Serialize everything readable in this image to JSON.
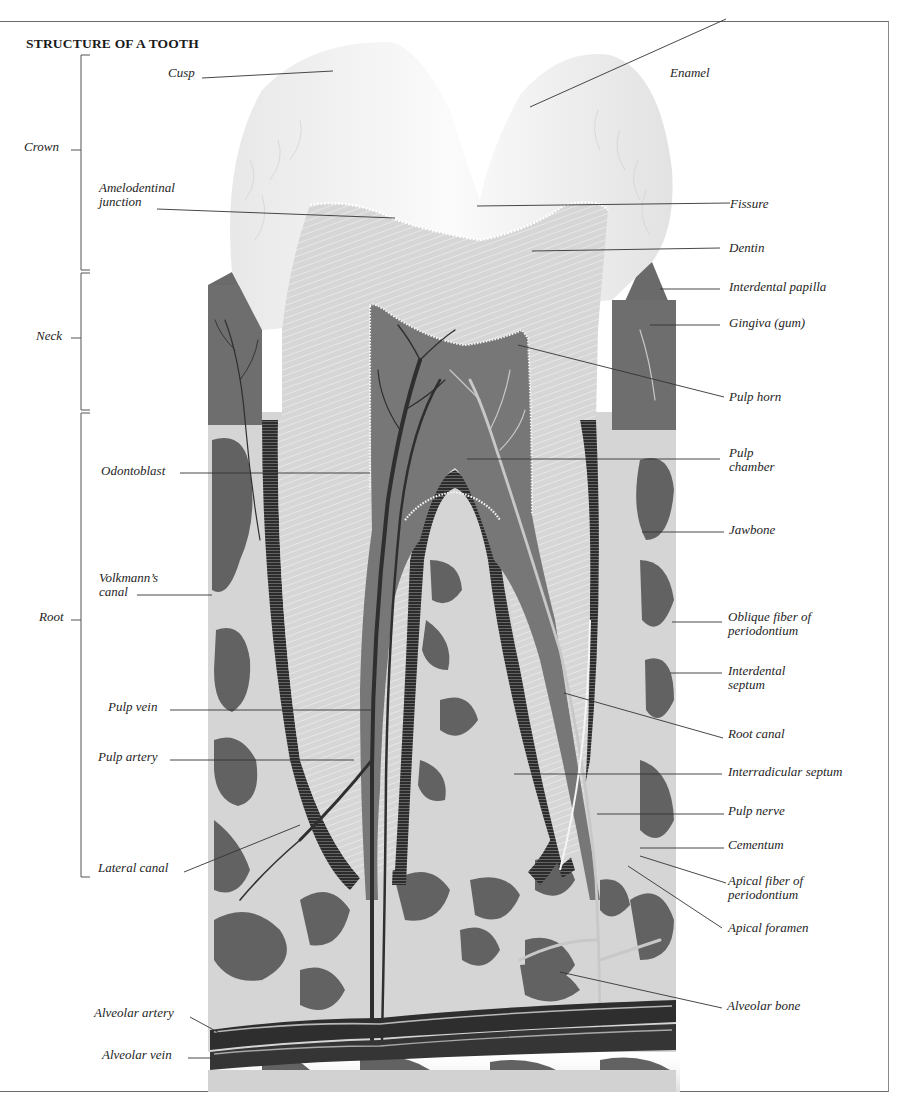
{
  "title": "STRUCTURE OF A TOOTH",
  "regions": [
    {
      "label": "Crown",
      "top": 55,
      "bottom": 270,
      "label_y": 146
    },
    {
      "label": "Neck",
      "top": 273,
      "bottom": 410,
      "label_y": 334
    },
    {
      "label": "Root",
      "top": 413,
      "bottom": 877,
      "label_y": 616
    }
  ],
  "labels_left": [
    {
      "text": "Cusp",
      "lines": [
        "Cusp"
      ]
    },
    {
      "text": "Amelodentinal junction",
      "lines": [
        "Amelodentinal",
        "junction"
      ]
    },
    {
      "text": "Odontoblast",
      "lines": [
        "Odontoblast"
      ]
    },
    {
      "text": "Volkmann's canal",
      "lines": [
        "Volkmann’s",
        "canal"
      ]
    },
    {
      "text": "Pulp vein",
      "lines": [
        "Pulp vein"
      ]
    },
    {
      "text": "Pulp artery",
      "lines": [
        "Pulp artery"
      ]
    },
    {
      "text": "Lateral canal",
      "lines": [
        "Lateral canal"
      ]
    },
    {
      "text": "Alveolar artery",
      "lines": [
        "Alveolar artery"
      ]
    },
    {
      "text": "Alveolar vein",
      "lines": [
        "Alveolar vein"
      ]
    }
  ],
  "labels_right": [
    {
      "text": "Enamel",
      "lines": [
        "Enamel"
      ]
    },
    {
      "text": "Fissure",
      "lines": [
        "Fissure"
      ]
    },
    {
      "text": "Dentin",
      "lines": [
        "Dentin"
      ]
    },
    {
      "text": "Interdental papilla",
      "lines": [
        "Interdental papilla"
      ]
    },
    {
      "text": "Gingiva (gum)",
      "lines": [
        "Gingiva (gum)"
      ]
    },
    {
      "text": "Pulp horn",
      "lines": [
        "Pulp horn"
      ]
    },
    {
      "text": "Pulp chamber",
      "lines": [
        "Pulp",
        "chamber"
      ]
    },
    {
      "text": "Jawbone",
      "lines": [
        "Jawbone"
      ]
    },
    {
      "text": "Oblique fiber of periodontium",
      "lines": [
        "Oblique fiber of",
        "periodontium"
      ]
    },
    {
      "text": "Interdental septum",
      "lines": [
        "Interdental",
        "septum"
      ]
    },
    {
      "text": "Root canal",
      "lines": [
        "Root canal"
      ]
    },
    {
      "text": "Interradicular septum",
      "lines": [
        "Interradicular septum"
      ]
    },
    {
      "text": "Pulp nerve",
      "lines": [
        "Pulp nerve"
      ]
    },
    {
      "text": "Cementum",
      "lines": [
        "Cementum"
      ]
    },
    {
      "text": "Apical fiber of periodontium",
      "lines": [
        "Apical fiber of",
        "periodontium"
      ]
    },
    {
      "text": "Apical foramen",
      "lines": [
        "Apical foramen"
      ]
    },
    {
      "text": "Alveolar bone",
      "lines": [
        "Alveolar bone"
      ]
    }
  ],
  "colors": {
    "enamel": "#f2f2f2",
    "dentin": "#dcdcdc",
    "gum": "#6f6f6f",
    "pulp": "#757575",
    "bone_light": "#d8d8d8",
    "bone_dark": "#616161",
    "vessel": "#3a3a3a",
    "leader": "#333333"
  }
}
